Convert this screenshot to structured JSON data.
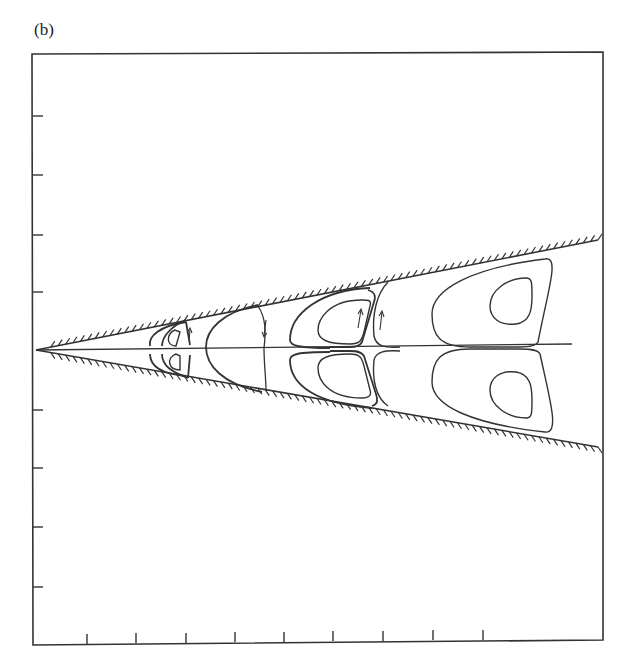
{
  "figure": {
    "panel_label": "(b)",
    "colors": {
      "line": "#333333",
      "background": "#ffffff"
    },
    "frame": {
      "left": 32,
      "top": 54,
      "right": 603,
      "bottom": 645
    },
    "left_axis_ticks_y": [
      116,
      175,
      235,
      292,
      410,
      468,
      527,
      587
    ],
    "bottom_axis_ticks_x": [
      87,
      136,
      186,
      235,
      284,
      333,
      383,
      433,
      483
    ],
    "apex": {
      "x": 36,
      "y": 350
    },
    "walls": {
      "upper_end": {
        "x": 598,
        "y": 240
      },
      "lower_end": {
        "x": 598,
        "y": 447
      }
    },
    "flow_direction_arrows": 4,
    "eddy_count": 5
  }
}
